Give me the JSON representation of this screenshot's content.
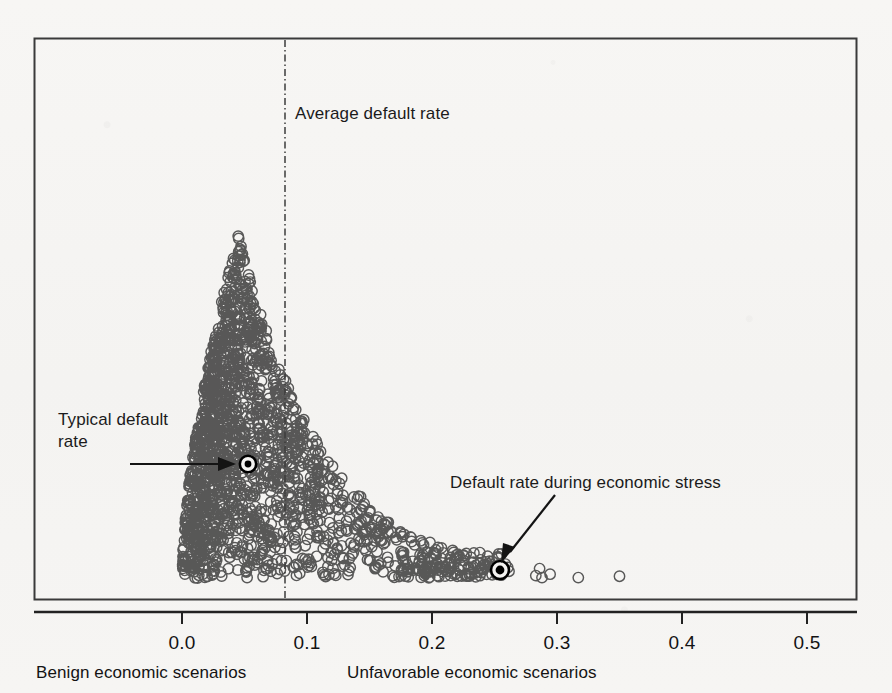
{
  "figure": {
    "background_color": "#f6f5f3",
    "frame_color": "#3a3a3a",
    "marker_color": "#4a4a4a",
    "highlight_color": "#000000"
  },
  "annotations": {
    "average_default_rate": "Average default rate",
    "typical_default_rate_line1": "Typical default",
    "typical_default_rate_line2": "rate",
    "stress_default_rate": "Default rate during economic stress"
  },
  "axis_captions": {
    "left": "Benign economic scenarios",
    "right": "Unfavorable economic scenarios"
  },
  "chart_data": {
    "type": "scatter",
    "title": "",
    "xlabel": "",
    "ylabel": "",
    "xlim": [
      -0.055,
      0.54
    ],
    "ylim": [
      0,
      1
    ],
    "grid": false,
    "legend": null,
    "xticks": [
      0.0,
      0.1,
      0.2,
      0.3,
      0.4,
      0.5
    ],
    "xtick_labels": [
      "0.0",
      "0.1",
      "0.2",
      "0.3",
      "0.4",
      "0.5"
    ],
    "yticks": [],
    "ytick_labels": [],
    "n_points": 1800,
    "distribution": {
      "shape": "right-skewed",
      "mode": 0.045,
      "mean": 0.082,
      "min": 0.0,
      "max": 0.35
    },
    "reference_lines": [
      {
        "name": "average-default-rate",
        "orientation": "vertical",
        "value": 0.082,
        "style": "dash-dot",
        "label": "Average default rate"
      }
    ],
    "highlighted_points": [
      {
        "name": "typical-default-rate",
        "x": 0.053,
        "y_frac": 0.245,
        "label": "Typical default rate",
        "marker": "filled-circle-with-ring"
      },
      {
        "name": "stress-default-rate",
        "x": 0.254,
        "y_frac": 0.053,
        "label": "Default rate during economic stress",
        "marker": "filled-circle-with-ring"
      }
    ],
    "outliers": [
      {
        "x": 0.283
      },
      {
        "x": 0.288
      },
      {
        "x": 0.317
      },
      {
        "x": 0.35
      }
    ]
  }
}
